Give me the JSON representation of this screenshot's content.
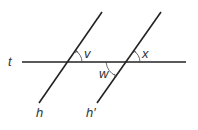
{
  "diagram": {
    "type": "parallel lines cut by a transversal",
    "lines": {
      "transversal": {
        "label": "t"
      },
      "line1": {
        "label": "h"
      },
      "line2": {
        "label": "h′"
      }
    },
    "angles": {
      "v": {
        "label": "v",
        "location": "above t, right of h"
      },
      "x": {
        "label": "x",
        "location": "above t, right of h′"
      },
      "w": {
        "label": "w",
        "location": "below t, left of h′"
      }
    },
    "colors": {
      "line": "#222222",
      "text": "#333333",
      "background": "#ffffff"
    }
  }
}
